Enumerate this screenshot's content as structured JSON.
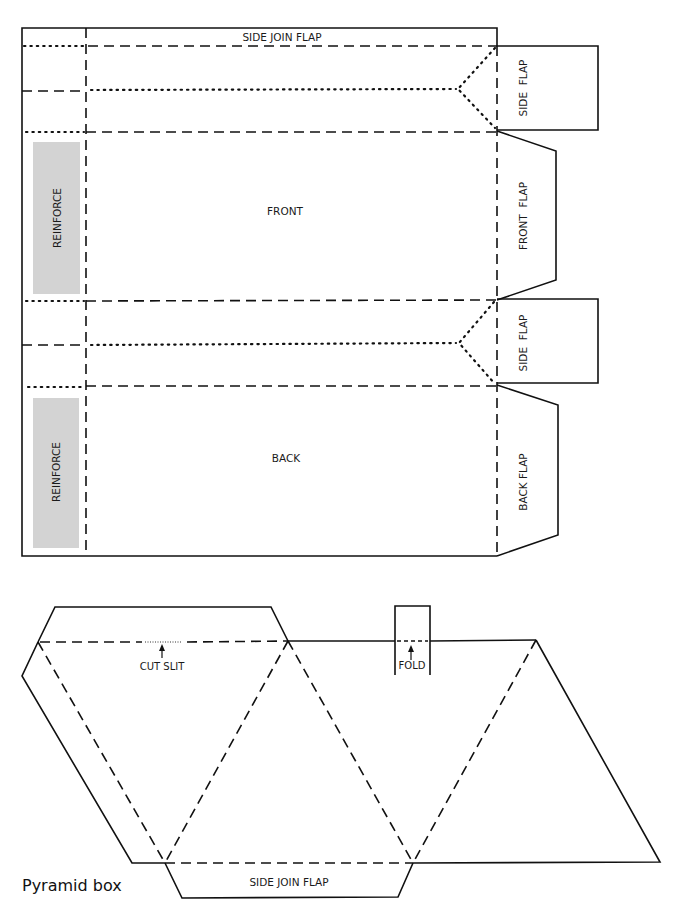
{
  "figure": {
    "caption": "Pyramid box",
    "colors": {
      "line": "#111111",
      "reinforce_fill": "#d3d3d3",
      "background": "#ffffff"
    }
  },
  "carton_template": {
    "labels": {
      "top_flap": "SIDE JOIN FLAP",
      "front_panel": "FRONT",
      "back_panel": "BACK",
      "reinforce_upper": "REINFORCE",
      "reinforce_lower": "REINFORCE",
      "side_flap_upper": "SIDE  FLAP",
      "front_flap": "FRONT  FLAP",
      "side_flap_lower": "SIDE  FLAP",
      "back_flap": "BACK FLAP"
    }
  },
  "pyramid_template": {
    "labels": {
      "cut_slit": "CUT SLIT",
      "fold": "FOLD",
      "bottom_flap": "SIDE JOIN FLAP"
    }
  },
  "legend_line_types": [
    "solid = cut",
    "dashed = fold",
    "dotted = score/crease"
  ]
}
